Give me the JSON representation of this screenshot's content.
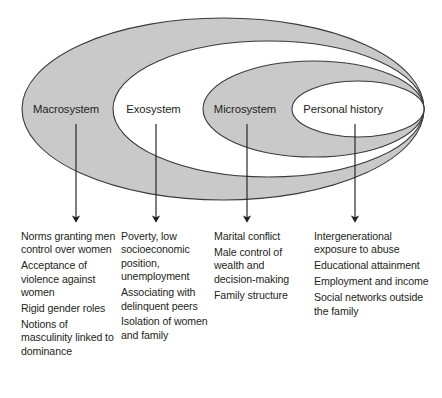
{
  "diagram": {
    "type": "nested-ellipse-ecological-model",
    "colors": {
      "ring_fill_shaded": "#c9c9c9",
      "ring_fill_light": "#ffffff",
      "stroke": "#3a3a3a",
      "text": "#231f20",
      "background": "#ffffff"
    },
    "rings": [
      {
        "id": "macrosystem",
        "label": "Macrosystem",
        "fill": "shaded",
        "order": 1
      },
      {
        "id": "exosystem",
        "label": "Exosystem",
        "fill": "light",
        "order": 2
      },
      {
        "id": "microsystem",
        "label": "Microsystem",
        "fill": "shaded",
        "order": 3
      },
      {
        "id": "personal_history",
        "label": "Personal history",
        "fill": "light",
        "order": 4
      }
    ],
    "arrows": [
      {
        "id": "arrow-macrosystem",
        "from": "macrosystem"
      },
      {
        "id": "arrow-exosystem",
        "from": "exosystem"
      },
      {
        "id": "arrow-microsystem",
        "from": "microsystem"
      },
      {
        "id": "arrow-personal-history",
        "from": "personal_history"
      }
    ],
    "columns": [
      {
        "id": "macrosystem-factors",
        "ring": "macrosystem",
        "items": [
          "Norms granting men control over women",
          "Acceptance of violence against women",
          "Rigid gender roles",
          "Notions of masculinity linked to dominance"
        ]
      },
      {
        "id": "exosystem-factors",
        "ring": "exosystem",
        "items": [
          "Poverty, low socioeconomic position, unemployment",
          "Associating with delinquent peers",
          "Isolation of women and family"
        ]
      },
      {
        "id": "microsystem-factors",
        "ring": "microsystem",
        "items": [
          "Marital conflict",
          "Male control of wealth and decision-making",
          "Family structure"
        ]
      },
      {
        "id": "personal-history-factors",
        "ring": "personal_history",
        "items": [
          "Intergenerational exposure to abuse",
          "Educational attainment",
          "Employment and income",
          "Social networks outside the family"
        ]
      }
    ]
  }
}
